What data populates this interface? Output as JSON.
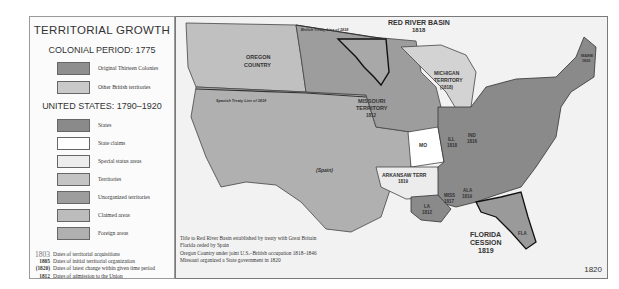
{
  "legend": {
    "title": "TERRITORIAL GROWTH",
    "colonial_heading": "COLONIAL PERIOD: 1775",
    "colonial_items": [
      {
        "label": "Original Thirteen Colonies",
        "color": "#8e8e8e"
      },
      {
        "label": "Other British territories",
        "color": "#c9c9c9"
      }
    ],
    "us_heading": "UNITED STATES: 1790–1920",
    "us_items": [
      {
        "label": "States",
        "color": "#8a8a8a"
      },
      {
        "label": "State claims",
        "color": "#ffffff"
      },
      {
        "label": "Special status areas",
        "color": "#ededed"
      },
      {
        "label": "Territories",
        "color": "#c4c4c4"
      },
      {
        "label": "Unorganized territories",
        "color": "#9d9d9d"
      },
      {
        "label": "Claimed areas",
        "color": "#bcbcbc"
      },
      {
        "label": "Foreign areas",
        "color": "#b0b0b0"
      }
    ],
    "notes": [
      {
        "key": "1803",
        "label": "Dates of territorial acquisitions"
      },
      {
        "key": "1805",
        "label": "Dates of initial territorial organization"
      },
      {
        "key": "(1820)",
        "label": "Dates of latest change within given time period"
      },
      {
        "key": "1812",
        "label": "Dates of admission to the Union"
      }
    ]
  },
  "map": {
    "year": "1820",
    "labels": {
      "oregon": "OREGON",
      "country": "COUNTRY",
      "british_treaty": "British Treaty Line of 1818",
      "red_river": "RED RIVER BASIN",
      "red_river_year": "1818",
      "michigan": "MICHIGAN",
      "territory": "TERRITORY",
      "michigan_year": "(1818)",
      "missouri": "MISSOURI",
      "missouri_year": "1812",
      "spanish_treaty": "Spanish Treaty Line of 1819",
      "spain": "(Spain)",
      "mo": "MO",
      "ill": "ILL",
      "ill_year": "1818",
      "ind": "IND",
      "ind_year": "1816",
      "arkansaw": "ARKANSAW TERR",
      "arkansaw_year": "1819",
      "la": "LA",
      "la_year": "1812",
      "miss": "MISS",
      "miss_year": "1817",
      "ala": "ALA",
      "ala_year": "1819",
      "florida": "FLORIDA",
      "cession": "CESSION",
      "florida_year": "1819",
      "fla": "FLA",
      "maine": "MAINE",
      "maine_year": "1820"
    },
    "caption": [
      "Title to Red River Basin established by treaty with Great Britain",
      "Florida ceded by Spain",
      "Oregon Country under joint U.S.–British occupation 1818–1846",
      "Missouri organized a State government in 1820"
    ]
  }
}
